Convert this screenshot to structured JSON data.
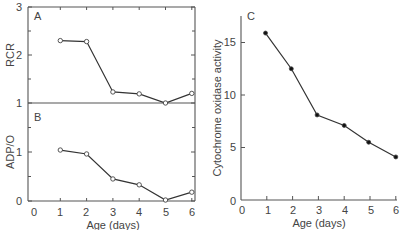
{
  "chart_data": [
    {
      "panel": "A",
      "type": "line",
      "xlabel": "",
      "ylabel": "RCR",
      "x": [
        1,
        2,
        3,
        4,
        5,
        6
      ],
      "series": [
        {
          "name": "RCR",
          "marker": "open-circle",
          "values": [
            2.3,
            2.28,
            1.23,
            1.19,
            1.0,
            1.2
          ]
        }
      ],
      "ylim": [
        1,
        3
      ],
      "yticks": [
        "1",
        "2",
        "3"
      ],
      "xlim": [
        0,
        6
      ],
      "grid": false
    },
    {
      "panel": "B",
      "type": "line",
      "xlabel": "Age (days)",
      "ylabel": "ADP/O",
      "x": [
        1,
        2,
        3,
        4,
        5,
        6
      ],
      "series": [
        {
          "name": "ADP/O",
          "marker": "open-circle",
          "values": [
            1.04,
            0.96,
            0.45,
            0.33,
            0.02,
            0.18
          ]
        }
      ],
      "ylim": [
        0,
        1.5
      ],
      "yticks": [
        "0",
        "1"
      ],
      "xlim": [
        0,
        6
      ],
      "xticks": [
        "0",
        "1",
        "2",
        "3",
        "4",
        "5",
        "6"
      ],
      "grid": false
    },
    {
      "panel": "C",
      "type": "line",
      "xlabel": "Age (days)",
      "ylabel": "Cytochrome oxidase activity",
      "x": [
        0.95,
        1.95,
        2.95,
        4.0,
        4.95,
        6.0
      ],
      "series": [
        {
          "name": "Cytochrome oxidase activity",
          "marker": "filled-circle",
          "values": [
            15.9,
            12.5,
            8.1,
            7.1,
            5.5,
            4.1
          ]
        }
      ],
      "ylim": [
        0,
        18
      ],
      "yticks": [
        "0",
        "5",
        "10",
        "15"
      ],
      "xlim": [
        0,
        6
      ],
      "xticks": [
        "0",
        "1",
        "2",
        "3",
        "4",
        "5",
        "6"
      ],
      "grid": false
    }
  ],
  "labels": {
    "panel_a": "A",
    "panel_b": "B",
    "panel_c": "C",
    "ylabel_a": "RCR",
    "ylabel_b": "ADP/O",
    "ylabel_c": "Cytochrome oxidase activity",
    "xlabel_ab": "Age (days)",
    "xlabel_c": "Age (days)",
    "ytick_a": [
      "1",
      "2",
      "3"
    ],
    "ytick_b": [
      "0",
      "1"
    ],
    "ytick_c": [
      "0",
      "5",
      "10",
      "15"
    ],
    "xticks": [
      "0",
      "1",
      "2",
      "3",
      "4",
      "5",
      "6"
    ]
  }
}
